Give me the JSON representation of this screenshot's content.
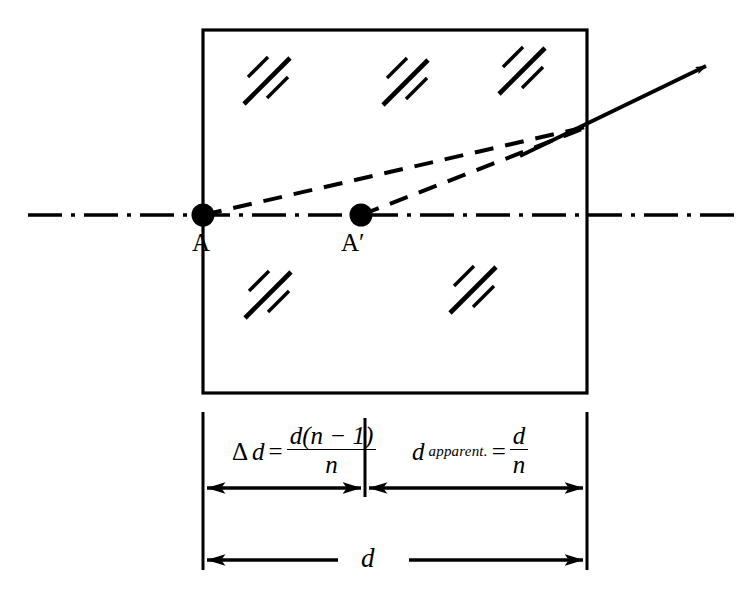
{
  "figure": {
    "points": [
      {
        "id": "A",
        "label": "A",
        "x": 203,
        "y": 215,
        "description": "real object point at front face of glass block"
      },
      {
        "id": "A-prime",
        "label": "A′",
        "x": 361,
        "y": 215,
        "description": "apparent (virtual) image point inside glass block"
      }
    ],
    "block": {
      "name": "glass-slab",
      "left": 203,
      "right": 587,
      "top": 30,
      "bottom": 393,
      "hatch_clusters": 5
    },
    "axis": {
      "name": "optical-axis",
      "style": "dash-dot",
      "y": 215,
      "x_start": 28,
      "x_end": 737
    },
    "rays": [
      {
        "name": "ray-from-A",
        "style": "dashed",
        "from_x": 203,
        "from_y": 215,
        "to_x": 590,
        "to_y": 126
      },
      {
        "name": "ray-from-A-prime",
        "style": "dashed",
        "from_x": 361,
        "from_y": 215,
        "to_x": 590,
        "to_y": 126
      },
      {
        "name": "refracted-ray",
        "style": "solid-arrow",
        "from_x": 520,
        "from_y": 156,
        "to_x": 712,
        "to_y": 63
      }
    ],
    "dimensions": [
      {
        "name": "delta-d",
        "from_x": 203,
        "to_x": 365,
        "arrow_y": 488,
        "formula": {
          "lhs_delta": "Δ",
          "lhs_var": "d",
          "equals": "=",
          "numerator": "d(n − 1)",
          "denominator": "n"
        },
        "plain_text": "Δd = d(n−1)/n"
      },
      {
        "name": "d-apparent",
        "from_x": 365,
        "to_x": 587,
        "arrow_y": 488,
        "formula": {
          "lhs_var": "d",
          "lhs_subscript": "apparent.",
          "equals": "=",
          "numerator": "d",
          "denominator": "n"
        },
        "plain_text": "d_apparent. = d/n"
      },
      {
        "name": "total-d",
        "from_x": 203,
        "to_x": 587,
        "arrow_y": 560,
        "label": "d",
        "plain_text": "d"
      }
    ],
    "colors": {
      "ink": "#000000",
      "background": "#ffffff"
    }
  }
}
